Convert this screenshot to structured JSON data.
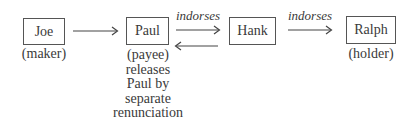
{
  "nodes": {
    "joe": {
      "name": "Joe",
      "role": "(maker)"
    },
    "paul": {
      "name": "Paul",
      "role": "(payee)",
      "note_lines": [
        "releases",
        "Paul by",
        "separate",
        "renunciation"
      ]
    },
    "hank": {
      "name": "Hank"
    },
    "ralph": {
      "name": "Ralph",
      "role": "(holder)"
    }
  },
  "edges": {
    "joe_to_paul": {
      "label": ""
    },
    "paul_to_hank": {
      "label": "indorses"
    },
    "hank_to_paul": {
      "label": ""
    },
    "hank_to_ralph": {
      "label": "indorses"
    }
  }
}
